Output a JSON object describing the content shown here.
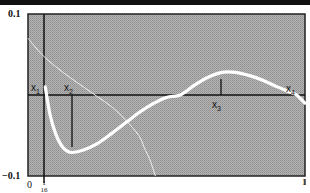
{
  "chart_data": {
    "type": "line",
    "title": "",
    "xlabel": "",
    "ylabel": "",
    "xlim": [
      0,
      1
    ],
    "ylim": [
      -0.1,
      0.1
    ],
    "grid": false,
    "background": "halftone gray",
    "y_ticks": [
      "0.1",
      "-0.1"
    ],
    "x_ticks": [
      "0",
      "1/16",
      "1"
    ],
    "annotations": [
      {
        "label": "x1",
        "x": 0.0625,
        "note": "vertical line at x = 1/16"
      },
      {
        "label": "x2",
        "x": 0.16,
        "note": "vertical line at curve minimum"
      },
      {
        "label": "x3",
        "x": 0.7,
        "note": "tick at curve maximum"
      },
      {
        "label": "x4",
        "x": 0.97,
        "note": "zero crossing near right edge"
      }
    ],
    "series": [
      {
        "name": "main curve (thick white)",
        "x": [
          0.0625,
          0.08,
          0.1,
          0.12,
          0.14,
          0.16,
          0.2,
          0.25,
          0.3,
          0.35,
          0.4,
          0.45,
          0.5,
          0.55,
          0.6,
          0.65,
          0.7,
          0.75,
          0.8,
          0.85,
          0.9,
          0.95,
          0.97,
          1.0
        ],
        "y": [
          0.01,
          -0.025,
          -0.048,
          -0.062,
          -0.069,
          -0.071,
          -0.068,
          -0.06,
          -0.048,
          -0.035,
          -0.022,
          -0.011,
          -0.003,
          0.0,
          0.012,
          0.022,
          0.028,
          0.028,
          0.024,
          0.018,
          0.01,
          0.003,
          0.0,
          -0.01
        ]
      },
      {
        "name": "secondary curve (thin white)",
        "x": [
          0.0,
          0.05,
          0.1,
          0.15,
          0.2,
          0.25,
          0.3,
          0.35,
          0.4,
          0.42,
          0.44,
          0.46
        ],
        "y": [
          0.07,
          0.05,
          0.035,
          0.022,
          0.01,
          -0.002,
          -0.014,
          -0.03,
          -0.05,
          -0.065,
          -0.08,
          -0.1
        ]
      }
    ]
  },
  "labels": {
    "y_top": "0.1",
    "y_bottom": "−0.1",
    "x_zero": "0",
    "x_one": "1",
    "x_frac_num": "1",
    "x_frac_den": "16",
    "x1": "x",
    "x1_sub": "1",
    "x2": "x",
    "x2_sub": "2",
    "x3": "x",
    "x3_sub": "3",
    "x4": "x",
    "x4_sub": "4"
  }
}
